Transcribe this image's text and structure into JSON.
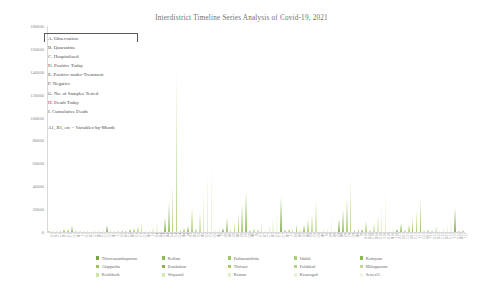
{
  "chart_data": {
    "type": "bar",
    "title": "Interdistrict Timeline Series Analysis of Covid-19, 2021",
    "xlabel": "",
    "ylabel": "",
    "ylim": [
      0,
      180000
    ],
    "yticks": [
      0,
      20000,
      40000,
      60000,
      80000,
      100000,
      120000,
      140000,
      160000,
      180000
    ],
    "ytick_labels": [
      "0",
      "20000",
      "40000",
      "60000",
      "80000",
      "100000",
      "120000",
      "140000",
      "160000",
      "180000"
    ],
    "grid": false,
    "legend_position": "bottom",
    "bar_color": "#9acd5e",
    "categories": [
      "A1",
      "B1",
      "C1",
      "D1",
      "E1",
      "F1",
      "G1",
      "H1",
      "I1",
      "A2",
      "B2",
      "C2",
      "D2",
      "E2",
      "F2",
      "G2",
      "H2",
      "I2",
      "A3",
      "B3",
      "C3",
      "D3",
      "E3",
      "F3",
      "G3",
      "H3",
      "I3",
      "A4",
      "B4",
      "C4",
      "D4",
      "E4",
      "F4",
      "G4",
      "H4",
      "I4",
      "A5",
      "B5",
      "C5",
      "D5",
      "E5",
      "F5",
      "G5",
      "H5",
      "I5",
      "A6",
      "B6",
      "C6",
      "D6",
      "E6",
      "F6",
      "G6",
      "H6",
      "I6",
      "A7",
      "B7",
      "C7",
      "D7",
      "E7",
      "F7",
      "G7",
      "H7",
      "I7",
      "A8",
      "B8",
      "C8",
      "D8",
      "E8",
      "F8",
      "G8",
      "H8",
      "I8",
      "A9",
      "B9",
      "C9",
      "D9",
      "E9",
      "F9",
      "G9",
      "H9",
      "I9",
      "A10",
      "B10",
      "C10",
      "D10",
      "E10",
      "F10",
      "G10",
      "H10",
      "I10",
      "A11",
      "B11",
      "C11",
      "D11",
      "E11",
      "F11",
      "G11",
      "H11",
      "I11",
      "A12",
      "B12",
      "C12",
      "D12",
      "E12",
      "F12",
      "G12",
      "H12",
      "I12"
    ],
    "values": [
      900,
      1200,
      700,
      1500,
      2200,
      3000,
      5200,
      300,
      800,
      1100,
      1400,
      900,
      1800,
      2600,
      3600,
      6400,
      400,
      1000,
      1500,
      2000,
      1100,
      2400,
      3800,
      5200,
      9800,
      600,
      1400,
      4200,
      9500,
      2600,
      12000,
      26000,
      41000,
      143000,
      1500,
      3600,
      5200,
      21000,
      3200,
      18000,
      33000,
      52000,
      62000,
      2400,
      4800,
      3100,
      12000,
      2100,
      9000,
      17000,
      24000,
      36000,
      1700,
      3300,
      2600,
      8500,
      1800,
      7000,
      13000,
      19000,
      31000,
      1400,
      2900,
      2200,
      7200,
      1500,
      6200,
      11000,
      16000,
      27000,
      1200,
      2500,
      3400,
      14000,
      2300,
      11000,
      20000,
      29000,
      47000,
      1900,
      3700,
      2900,
      10000,
      1900,
      8200,
      15000,
      22000,
      38000,
      1600,
      3100,
      2400,
      8000,
      1600,
      6600,
      12000,
      18000,
      29000,
      1300,
      2700,
      1800,
      5400,
      1200,
      4600,
      8500,
      13000,
      21000,
      1000,
      2100
    ],
    "series_note": "Stacked district series; visible envelope shown",
    "variable_key": {
      "rows": [
        "A. Observation",
        "B. Quarantine",
        "C. Hospitalized",
        "D. Positive Today",
        "E. Positive-under-Treatment",
        "F. Negative",
        "G. No. of Samples Tested",
        "H. Death Today",
        "I. Cumulative Death"
      ],
      "note": "A1, B1, etc = Variables-by-Month"
    },
    "legend": [
      {
        "label": "Thiruvananthapuram",
        "color": "#7aa842"
      },
      {
        "label": "Kollam",
        "color": "#8fbb52"
      },
      {
        "label": "Pathanamthitta",
        "color": "#9ec863"
      },
      {
        "label": "Idukki",
        "color": "#a9d072"
      },
      {
        "label": "Kottayam",
        "color": "#8bb94e"
      },
      {
        "label": "Alappuzha",
        "color": "#9cc65c"
      },
      {
        "label": "Ernakulam",
        "color": "#86b44a"
      },
      {
        "label": "Thrissur",
        "color": "#a3cc68"
      },
      {
        "label": "Palakkad",
        "color": "#b2d67f"
      },
      {
        "label": "Malappuram",
        "color": "#c0de92"
      },
      {
        "label": "Kozhikode",
        "color": "#cde6a6"
      },
      {
        "label": "Wayanad",
        "color": "#d6ebb4"
      },
      {
        "label": "Kannur",
        "color": "#dff0c3"
      },
      {
        "label": "Kasaragod",
        "color": "#e6f3d2"
      },
      {
        "label": "Series15",
        "color": "#eef7e2"
      }
    ]
  }
}
